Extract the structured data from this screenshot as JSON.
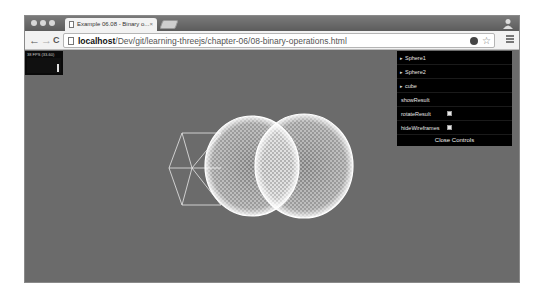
{
  "browser": {
    "tab_title": "Example 06.08 - Binary o...",
    "tab_close": "×",
    "url_host": "localhost",
    "url_path": "/Dev/git/learning-threejs/chapter-06/08-binary-operations.html",
    "nav": {
      "back": "←",
      "forward": "→",
      "reload": "C"
    },
    "star": "☆"
  },
  "stats": {
    "text": "38 FPS (33-60)"
  },
  "controls": {
    "folders": [
      {
        "label": "Sphere1",
        "arrow": "▸"
      },
      {
        "label": "Sphere2",
        "arrow": "▸"
      },
      {
        "label": "cube",
        "arrow": "▸"
      }
    ],
    "show_result": "showResult",
    "rotate_result": {
      "label": "rotateResult",
      "checked": false
    },
    "hide_wireframes": {
      "label": "hideWireframes",
      "checked": false
    },
    "close_label": "Close Controls"
  },
  "scene": {
    "background": "#6b6b6b",
    "wire_color": "#ffffff",
    "objects": [
      "sphere1",
      "sphere2",
      "cube"
    ]
  }
}
